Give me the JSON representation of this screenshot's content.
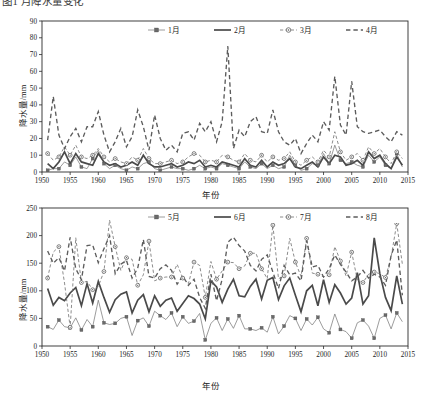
{
  "caption": {
    "top_cropped_text": "图1 月降水量变化"
  },
  "charts": [
    {
      "id": "chart-precip-jan-apr",
      "ylabel": "降水量/mm",
      "xlabel": "年份",
      "y_ticks": [
        0,
        10,
        20,
        30,
        40,
        50,
        60,
        70,
        80,
        90
      ],
      "x_ticks": [
        1950,
        1955,
        1960,
        1965,
        1970,
        1975,
        1980,
        1985,
        1990,
        1995,
        2000,
        2005,
        2010,
        2015
      ],
      "legend": [
        {
          "label": "1月",
          "style": "line-square"
        },
        {
          "label": "2月",
          "style": "line-thick"
        },
        {
          "label": "3月",
          "style": "dash-circle"
        },
        {
          "label": "4月",
          "style": "dash"
        }
      ]
    },
    {
      "id": "chart-precip-may-aug",
      "ylabel": "降水量/mm",
      "xlabel": "年份",
      "y_ticks": [
        0,
        50,
        100,
        150,
        200,
        250
      ],
      "x_ticks": [
        1950,
        1955,
        1960,
        1965,
        1970,
        1975,
        1980,
        1985,
        1990,
        1995,
        2000,
        2005,
        2010,
        2015
      ],
      "legend": [
        {
          "label": "5月",
          "style": "line-square"
        },
        {
          "label": "6月",
          "style": "line-thick"
        },
        {
          "label": "7月",
          "style": "dash-circle"
        },
        {
          "label": "8月",
          "style": "dash"
        }
      ]
    }
  ],
  "chart_data": [
    {
      "type": "line",
      "title": "",
      "xlabel": "年份",
      "ylabel": "降水量/mm",
      "xlim": [
        1950,
        2015
      ],
      "ylim": [
        0,
        90
      ],
      "grid": false,
      "legend_position": "top-center-inside",
      "x": [
        1951,
        1952,
        1953,
        1954,
        1955,
        1956,
        1957,
        1958,
        1959,
        1960,
        1961,
        1962,
        1963,
        1964,
        1965,
        1966,
        1967,
        1968,
        1969,
        1970,
        1971,
        1972,
        1973,
        1974,
        1975,
        1976,
        1977,
        1978,
        1979,
        1980,
        1981,
        1982,
        1983,
        1984,
        1985,
        1986,
        1987,
        1988,
        1989,
        1990,
        1991,
        1992,
        1993,
        1994,
        1995,
        1996,
        1997,
        1998,
        1999,
        2000,
        2001,
        2002,
        2003,
        2004,
        2005,
        2006,
        2007,
        2008,
        2009,
        2010,
        2011,
        2012,
        2013,
        2014
      ],
      "series": [
        {
          "name": "1月",
          "marker": "filled-square",
          "linestyle": "solid-thin",
          "values": [
            1,
            2,
            2,
            6,
            4,
            9,
            3,
            2,
            8,
            13,
            5,
            2,
            4,
            2,
            1,
            3,
            2,
            5,
            6,
            2,
            1,
            2,
            3,
            2,
            2,
            1,
            2,
            4,
            2,
            3,
            2,
            5,
            4,
            3,
            2,
            6,
            3,
            2,
            5,
            2,
            4,
            2,
            3,
            10,
            4,
            1,
            2,
            5,
            4,
            11,
            5,
            16,
            7,
            5,
            6,
            4,
            3,
            10,
            6,
            9,
            4,
            2,
            11,
            3
          ]
        },
        {
          "name": "2月",
          "marker": "none",
          "linestyle": "solid-thick",
          "values": [
            5,
            2,
            6,
            12,
            5,
            11,
            6,
            5,
            4,
            11,
            6,
            4,
            5,
            3,
            4,
            6,
            4,
            10,
            5,
            3,
            3,
            4,
            5,
            3,
            4,
            6,
            5,
            7,
            3,
            4,
            3,
            6,
            5,
            4,
            3,
            8,
            4,
            3,
            7,
            3,
            6,
            4,
            5,
            8,
            3,
            2,
            4,
            6,
            3,
            9,
            5,
            10,
            9,
            4,
            5,
            7,
            4,
            12,
            8,
            10,
            5,
            2,
            9,
            4
          ]
        },
        {
          "name": "3月",
          "marker": "open-circle",
          "linestyle": "dashed-thin",
          "values": [
            11,
            7,
            9,
            15,
            10,
            16,
            9,
            8,
            10,
            14,
            9,
            6,
            8,
            6,
            5,
            9,
            7,
            14,
            8,
            5,
            5,
            6,
            7,
            5,
            6,
            9,
            11,
            10,
            6,
            7,
            6,
            10,
            9,
            7,
            6,
            11,
            7,
            6,
            10,
            6,
            9,
            7,
            8,
            12,
            6,
            4,
            7,
            9,
            6,
            13,
            9,
            24,
            12,
            7,
            9,
            11,
            7,
            15,
            11,
            14,
            9,
            5,
            12,
            8
          ]
        },
        {
          "name": "4月",
          "marker": "none",
          "linestyle": "dashed-thick",
          "values": [
            19,
            45,
            22,
            14,
            21,
            26,
            18,
            27,
            27,
            36,
            22,
            12,
            18,
            26,
            15,
            21,
            37,
            27,
            13,
            34,
            20,
            13,
            16,
            12,
            23,
            24,
            19,
            29,
            24,
            30,
            18,
            30,
            75,
            14,
            25,
            21,
            30,
            33,
            24,
            23,
            37,
            24,
            18,
            16,
            20,
            11,
            17,
            22,
            18,
            30,
            25,
            57,
            28,
            22,
            54,
            27,
            24,
            23,
            24,
            25,
            21,
            18,
            24,
            22
          ]
        }
      ]
    },
    {
      "type": "line",
      "title": "",
      "xlabel": "年份",
      "ylabel": "降水量/mm",
      "xlim": [
        1950,
        2015
      ],
      "ylim": [
        0,
        250
      ],
      "grid": false,
      "legend_position": "top-center-inside",
      "x": [
        1951,
        1952,
        1953,
        1954,
        1955,
        1956,
        1957,
        1958,
        1959,
        1960,
        1961,
        1962,
        1963,
        1964,
        1965,
        1966,
        1967,
        1968,
        1969,
        1970,
        1971,
        1972,
        1973,
        1974,
        1975,
        1976,
        1977,
        1978,
        1979,
        1980,
        1981,
        1982,
        1983,
        1984,
        1985,
        1986,
        1987,
        1988,
        1989,
        1990,
        1991,
        1992,
        1993,
        1994,
        1995,
        1996,
        1997,
        1998,
        1999,
        2000,
        2001,
        2002,
        2003,
        2004,
        2005,
        2006,
        2007,
        2008,
        2009,
        2010,
        2011,
        2012,
        2013,
        2014
      ],
      "series": [
        {
          "name": "5月",
          "marker": "filled-square",
          "linestyle": "solid-thin",
          "values": [
            35,
            30,
            47,
            35,
            33,
            51,
            29,
            48,
            35,
            83,
            42,
            39,
            41,
            50,
            53,
            19,
            46,
            51,
            36,
            63,
            55,
            48,
            60,
            35,
            53,
            41,
            45,
            59,
            11,
            41,
            51,
            28,
            49,
            32,
            55,
            31,
            31,
            28,
            33,
            25,
            53,
            22,
            36,
            55,
            50,
            28,
            49,
            38,
            52,
            31,
            24,
            58,
            30,
            26,
            14,
            42,
            47,
            36,
            14,
            50,
            56,
            31,
            60,
            44
          ]
        },
        {
          "name": "6月",
          "marker": "none",
          "linestyle": "solid-thick",
          "values": [
            104,
            74,
            88,
            82,
            96,
            106,
            73,
            113,
            78,
            117,
            88,
            61,
            84,
            94,
            98,
            60,
            83,
            93,
            62,
            91,
            72,
            83,
            87,
            63,
            77,
            91,
            86,
            76,
            49,
            118,
            107,
            79,
            103,
            121,
            91,
            89,
            108,
            121,
            85,
            119,
            124,
            84,
            109,
            123,
            92,
            62,
            100,
            110,
            73,
            120,
            79,
            111,
            96,
            76,
            87,
            133,
            76,
            91,
            196,
            131,
            88,
            64,
            127,
            76
          ]
        },
        {
          "name": "7月",
          "marker": "open-circle",
          "linestyle": "dashed-thin",
          "values": [
            123,
            170,
            180,
            114,
            34,
            196,
            115,
            117,
            102,
            108,
            135,
            228,
            180,
            137,
            160,
            157,
            110,
            129,
            190,
            118,
            123,
            125,
            125,
            148,
            123,
            113,
            152,
            146,
            88,
            153,
            121,
            136,
            152,
            151,
            140,
            145,
            168,
            168,
            140,
            122,
            219,
            122,
            127,
            195,
            152,
            126,
            195,
            132,
            130,
            125,
            129,
            180,
            154,
            127,
            170,
            120,
            115,
            130,
            134,
            131,
            124,
            161,
            222,
            148
          ]
        },
        {
          "name": "8月",
          "marker": "none",
          "linestyle": "dashed-thick",
          "values": [
            172,
            150,
            160,
            136,
            197,
            140,
            120,
            182,
            183,
            151,
            176,
            200,
            131,
            148,
            155,
            123,
            141,
            193,
            126,
            123,
            140,
            147,
            137,
            112,
            127,
            110,
            121,
            88,
            68,
            130,
            82,
            121,
            188,
            197,
            182,
            172,
            146,
            136,
            157,
            165,
            134,
            104,
            146,
            129,
            132,
            118,
            191,
            143,
            146,
            125,
            140,
            165,
            148,
            134,
            118,
            125,
            137,
            123,
            130,
            125,
            110,
            164,
            192,
            92
          ]
        }
      ]
    }
  ]
}
